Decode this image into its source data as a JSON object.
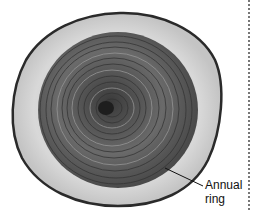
{
  "figure": {
    "annotation": {
      "line1": "Annual",
      "line2": "ring"
    },
    "colors": {
      "bark": "#2a2a2a",
      "sapwood": "#cfcfcf",
      "heartwood": "#5a5a5a",
      "rings_dark": "#3a3a3a",
      "rings_light": "#8a8a8a",
      "pith": "#1e1e1e"
    }
  }
}
